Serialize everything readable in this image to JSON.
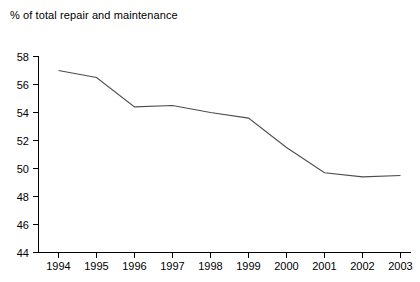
{
  "chart_data": {
    "type": "line",
    "title": "% of total repair and maintenance",
    "xlabel": "",
    "ylabel": "% of total repair and maintenance",
    "categories": [
      "1994",
      "1995",
      "1996",
      "1997",
      "1998",
      "1999",
      "2000",
      "2001",
      "2002",
      "2003"
    ],
    "x": [
      1994,
      1995,
      1996,
      1997,
      1998,
      1999,
      2000,
      2001,
      2002,
      2003
    ],
    "values": [
      57.0,
      56.5,
      54.4,
      54.5,
      54.0,
      53.6,
      51.5,
      49.7,
      49.4,
      49.5
    ],
    "series": [
      {
        "name": "% of total repair and maintenance",
        "values": [
          57.0,
          56.5,
          54.4,
          54.5,
          54.0,
          53.6,
          51.5,
          49.7,
          49.4,
          49.5
        ]
      }
    ],
    "ylim": [
      44,
      58
    ],
    "yticks": [
      44,
      46,
      48,
      50,
      52,
      54,
      56,
      58
    ],
    "ytick_labels": [
      "44",
      "46",
      "48",
      "50",
      "52",
      "54",
      "56",
      "58"
    ],
    "xtick_labels": [
      "1994",
      "1995",
      "1996",
      "1997",
      "1998",
      "1999",
      "2000",
      "2001",
      "2002",
      "2003"
    ],
    "grid": false,
    "legend": false,
    "legend_position": "none",
    "line_color": "#4d4d4d",
    "axis_color": "#000000",
    "background_color": "#ffffff"
  }
}
